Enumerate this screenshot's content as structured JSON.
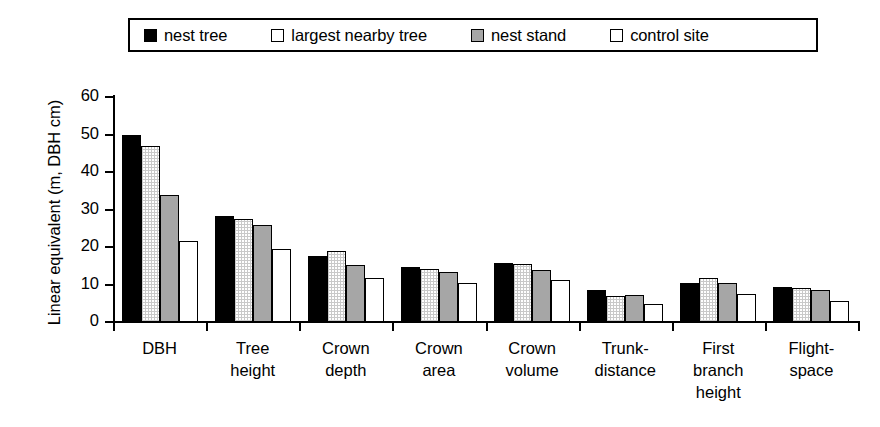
{
  "chart_data": {
    "type": "bar",
    "title": "",
    "xlabel": "",
    "ylabel": "Linear equivalent (m, DBH cm)",
    "ylim": [
      0,
      60
    ],
    "yticks": [
      0,
      10,
      20,
      30,
      40,
      50,
      60
    ],
    "ytick_labels": [
      "0",
      "10",
      "20",
      "30",
      "40",
      "50",
      "60"
    ],
    "grid": false,
    "legend_position": "top",
    "categories": [
      "DBH",
      "Tree\nheight",
      "Crown\ndepth",
      "Crown\narea",
      "Crown\nvolume",
      "Trunk-\ndistance",
      "First\nbranch\nheight",
      "Flight-\nspace"
    ],
    "series": [
      {
        "name": "nest tree",
        "fill": "solid-black",
        "color": "#000000",
        "values": [
          50.0,
          28.2,
          17.6,
          14.8,
          15.8,
          8.5,
          10.4,
          9.3
        ]
      },
      {
        "name": "largest nearby tree",
        "fill": "dotted-white",
        "color": "#ffffff",
        "values": [
          47.0,
          27.6,
          19.0,
          14.2,
          15.6,
          7.0,
          11.8,
          9.0
        ]
      },
      {
        "name": "nest stand",
        "fill": "solid-gray",
        "color": "#a6a6a6",
        "values": [
          33.8,
          25.8,
          15.3,
          13.3,
          14.0,
          7.1,
          10.4,
          8.5
        ]
      },
      {
        "name": "control site",
        "fill": "solid-white",
        "color": "#ffffff",
        "values": [
          21.6,
          19.5,
          11.8,
          10.4,
          11.1,
          4.8,
          7.5,
          5.5
        ]
      }
    ]
  },
  "legend": {
    "items": [
      {
        "label": "nest tree",
        "swatch": "solid-black-square-icon"
      },
      {
        "label": "largest nearby tree",
        "swatch": "open-square-icon"
      },
      {
        "label": "nest stand",
        "swatch": "gray-square-icon"
      },
      {
        "label": "control site",
        "swatch": "open-square-icon"
      }
    ]
  }
}
